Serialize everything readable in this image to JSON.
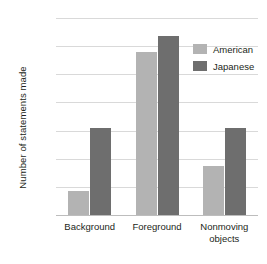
{
  "chart_data": {
    "type": "bar",
    "title": "",
    "xlabel": "",
    "ylabel": "Number of statements made",
    "categories": [
      "Background",
      "Foreground",
      "Nonmoving objects"
    ],
    "series": [
      {
        "name": "American",
        "color": "#b3b3b3",
        "values": [
          17,
          116,
          35
        ]
      },
      {
        "name": "Japanese",
        "color": "#6e6e6e",
        "values": [
          62,
          127,
          62
        ]
      }
    ],
    "ylim": [
      0,
      140
    ],
    "yticks": [
      0,
      20,
      40,
      60,
      80,
      100,
      120,
      140
    ],
    "ytick_labels": [
      "0",
      "20",
      "40",
      "60",
      "80",
      "100",
      "120",
      "140"
    ],
    "grid": true,
    "legend_position": "top-right"
  },
  "axis": {
    "y_title": "Number of statements made",
    "ticks": [
      "140",
      "120",
      "100",
      "80",
      "60",
      "40",
      "20",
      "0"
    ]
  },
  "x_labels": [
    {
      "line1": "Background",
      "line2": ""
    },
    {
      "line1": "Foreground",
      "line2": ""
    },
    {
      "line1": "Nonmoving",
      "line2": "objects"
    }
  ],
  "legend": {
    "items": [
      {
        "label": "American",
        "color": "#b3b3b3"
      },
      {
        "label": "Japanese",
        "color": "#6e6e6e"
      }
    ]
  },
  "colors": {
    "american": "#b3b3b3",
    "japanese": "#6e6e6e",
    "gridline": "#d9d9d9",
    "baseline": "#bdbdbd",
    "text": "#231f20",
    "background": "#ffffff"
  }
}
